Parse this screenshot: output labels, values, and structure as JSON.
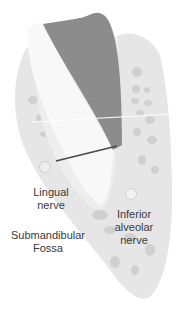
{
  "diagram": {
    "labels": {
      "lingual_nerve": "Lingual\nnerve",
      "inferior_alveolar_nerve": "Inferior\nalveolar\nnerve",
      "submandibular_fossa": "Submandibular\nFossa"
    },
    "colors": {
      "bone": "#e4e4e4",
      "bone_spots": "#cfcfcf",
      "tooth_root": "#f7f7f7",
      "implant_region": "#8c8c8c",
      "nerve_circle": "#eeeeee",
      "measure_line": "#4a4a4a",
      "text": "#3a3a3a"
    }
  }
}
